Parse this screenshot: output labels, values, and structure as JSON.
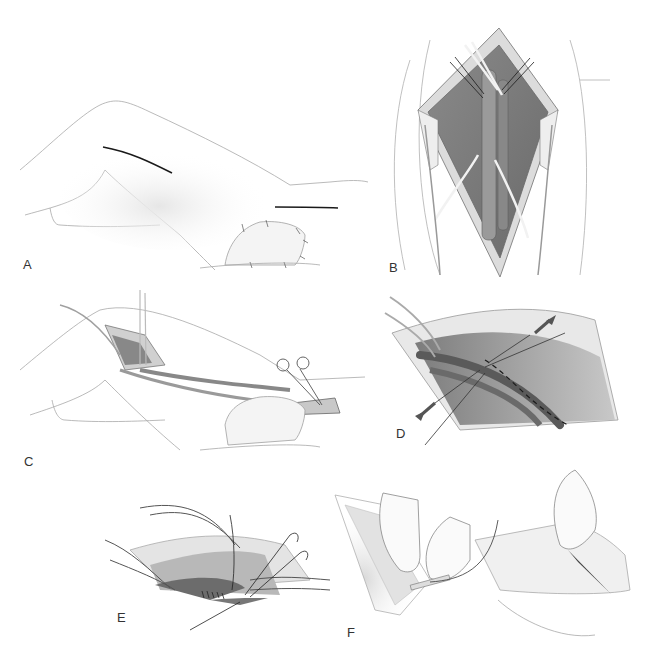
{
  "figure": {
    "background": "#ffffff",
    "line_color": "#9a9a9a",
    "tissue_color": "#8c8c8c",
    "incision_color": "#1a1a1a",
    "panels": [
      {
        "id": "A",
        "label": "A",
        "description": "Lateral view of flexed leg showing two skin incisions (thigh and below knee)"
      },
      {
        "id": "B",
        "label": "B",
        "description": "Opened diamond-shaped incision with retractors; vessel encircled with vessel loops"
      },
      {
        "id": "C",
        "label": "C",
        "description": "Graft tunneled between proximal and distal incisions; hemostat clamp at distal site"
      },
      {
        "id": "D",
        "label": "D",
        "description": "Close-up of anastomosis with traction sutures; arrows indicate pull direction; dashed suture line"
      },
      {
        "id": "E",
        "label": "E",
        "description": "Distal anastomosis with running sutures and vessel loops"
      },
      {
        "id": "F",
        "label": "F",
        "description": "Gloved hands passing graft through tunneler with foot in sterile drape"
      }
    ]
  }
}
